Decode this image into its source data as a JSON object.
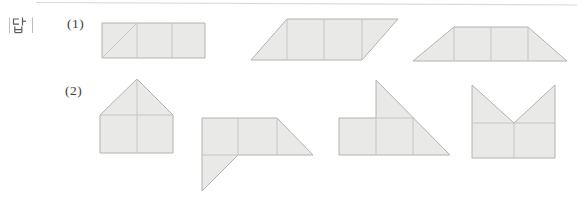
{
  "labels": {
    "answer": "|답|"
  },
  "figures": {
    "fill": "#e9e9e7",
    "outline_color": "#b2b2b0",
    "inner_line_color": "#c5c5c3",
    "top_rule": {
      "x1": 36,
      "y1": 2.5,
      "x2": 577,
      "y2": 5,
      "color": "#d9d9d9"
    },
    "rows": [
      {
        "label": "(1)",
        "shapes": [
          {
            "name": "rectangle-with-diagonal",
            "outline": [
              [
                102,
                23
              ],
              [
                205,
                23
              ],
              [
                205,
                58
              ],
              [
                102,
                58
              ]
            ],
            "inner_lines": [
              [
                [
                  137,
                  23
                ],
                [
                  137,
                  58
                ]
              ],
              [
                [
                  172,
                  23
                ],
                [
                  172,
                  58
                ]
              ],
              [
                [
                  102,
                  58
                ],
                [
                  137,
                  23
                ]
              ]
            ]
          },
          {
            "name": "parallelogram",
            "outline": [
              [
                287,
                19
              ],
              [
                398,
                19
              ],
              [
                362,
                60
              ],
              [
                251,
                60
              ]
            ],
            "inner_lines": [
              [
                [
                  287,
                  19
                ],
                [
                  287,
                  60
                ]
              ],
              [
                [
                  324,
                  19
                ],
                [
                  324,
                  60
                ]
              ],
              [
                [
                  362,
                  19
                ],
                [
                  362,
                  60
                ]
              ]
            ]
          },
          {
            "name": "trapezoid",
            "outline": [
              [
                454,
                27
              ],
              [
                528,
                27
              ],
              [
                567,
                61
              ],
              [
                413,
                61
              ]
            ],
            "inner_lines": [
              [
                [
                  454,
                  27
                ],
                [
                  454,
                  61
                ]
              ],
              [
                [
                  491,
                  27
                ],
                [
                  491,
                  61
                ]
              ],
              [
                [
                  528,
                  27
                ],
                [
                  528,
                  61
                ]
              ]
            ]
          }
        ]
      },
      {
        "label": "(2)",
        "shapes": [
          {
            "name": "house-shape",
            "outline": [
              [
                137,
                79
              ],
              [
                173,
                115
              ],
              [
                173,
                153
              ],
              [
                100,
                153
              ],
              [
                100,
                115
              ]
            ],
            "inner_lines": [
              [
                [
                  100,
                  115
                ],
                [
                  173,
                  115
                ]
              ],
              [
                [
                  137,
                  79
                ],
                [
                  137,
                  153
                ]
              ]
            ]
          },
          {
            "name": "flag-with-tail-shape",
            "outline": [
              [
                202,
                118
              ],
              [
                277,
                118
              ],
              [
                313,
                155
              ],
              [
                238,
                155
              ],
              [
                202,
                191
              ]
            ],
            "inner_lines": [
              [
                [
                  238,
                  118
                ],
                [
                  238,
                  155
                ]
              ],
              [
                [
                  277,
                  118
                ],
                [
                  277,
                  155
                ]
              ],
              [
                [
                  202,
                  155
                ],
                [
                  238,
                  155
                ]
              ]
            ]
          },
          {
            "name": "rectangle-with-large-triangle-shape",
            "outline": [
              [
                339,
                118
              ],
              [
                376,
                118
              ],
              [
                376,
                80
              ],
              [
                450,
                155
              ],
              [
                339,
                155
              ]
            ],
            "inner_lines": [
              [
                [
                  376,
                  118
                ],
                [
                  376,
                  155
                ]
              ],
              [
                [
                  413,
                  118
                ],
                [
                  413,
                  155
                ]
              ],
              [
                [
                  376,
                  118
                ],
                [
                  414,
                  118
                ]
              ]
            ]
          },
          {
            "name": "crown-shape",
            "outline": [
              [
                472,
                85
              ],
              [
                514,
                123
              ],
              [
                555,
                85
              ],
              [
                555,
                158
              ],
              [
                472,
                158
              ]
            ],
            "inner_lines": [
              [
                [
                  472,
                  123
                ],
                [
                  555,
                  123
                ]
              ],
              [
                [
                  514,
                  123
                ],
                [
                  514,
                  158
                ]
              ]
            ]
          }
        ]
      }
    ]
  }
}
